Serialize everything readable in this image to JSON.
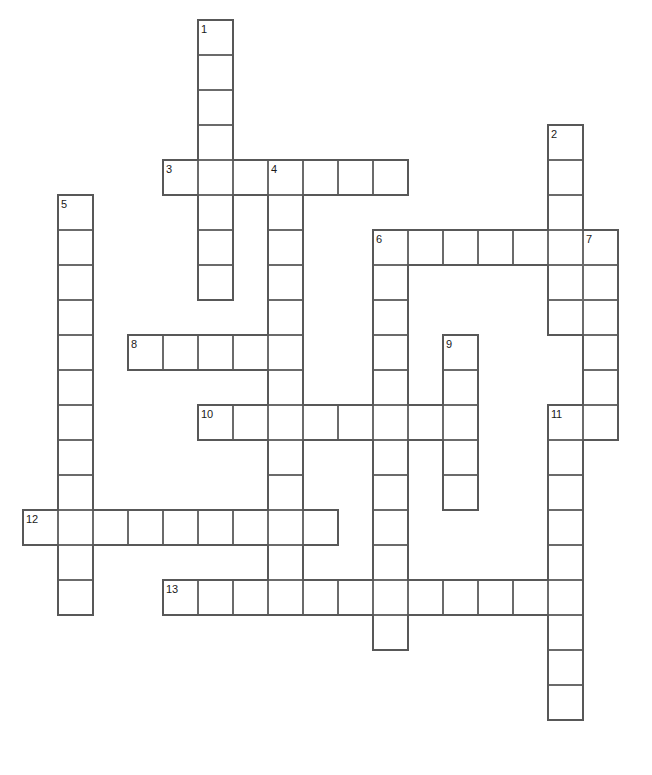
{
  "puzzle": {
    "title": "Crossword Puzzle Grid",
    "type": "crossword-grid",
    "cell_size": 35,
    "origin_x": 23,
    "origin_y": 20,
    "columns": 18,
    "rows": 21,
    "background_color": "#ffffff",
    "cell_border_color": "#6b6b6b",
    "outer_border_color": "#585858",
    "number_color": "#1a1a1a",
    "entries": [
      {
        "number": "1",
        "direction": "down",
        "col": 5,
        "row": 0,
        "length": 8
      },
      {
        "number": "2",
        "direction": "down",
        "col": 15,
        "row": 3,
        "length": 6
      },
      {
        "number": "3",
        "direction": "across",
        "col": 4,
        "row": 4,
        "length": 7
      },
      {
        "number": "4",
        "direction": "down",
        "col": 7,
        "row": 4,
        "length": 12
      },
      {
        "number": "5",
        "direction": "down",
        "col": 1,
        "row": 5,
        "length": 12
      },
      {
        "number": "6",
        "direction": "across",
        "col": 10,
        "row": 6,
        "length": 7
      },
      {
        "number": "6",
        "direction": "down",
        "col": 10,
        "row": 6,
        "length": 12
      },
      {
        "number": "7",
        "direction": "down",
        "col": 16,
        "row": 6,
        "length": 6
      },
      {
        "number": "8",
        "direction": "across",
        "col": 3,
        "row": 9,
        "length": 5
      },
      {
        "number": "9",
        "direction": "down",
        "col": 12,
        "row": 9,
        "length": 5
      },
      {
        "number": "10",
        "direction": "across",
        "col": 5,
        "row": 11,
        "length": 8
      },
      {
        "number": "11",
        "direction": "down",
        "col": 15,
        "row": 11,
        "length": 9
      },
      {
        "number": "12",
        "direction": "across",
        "col": 0,
        "row": 14,
        "length": 9
      },
      {
        "number": "13",
        "direction": "across",
        "col": 4,
        "row": 16,
        "length": 11
      }
    ],
    "numbered_labels": [
      {
        "label": "1",
        "col": 5,
        "row": 0
      },
      {
        "label": "2",
        "col": 15,
        "row": 3
      },
      {
        "label": "3",
        "col": 4,
        "row": 4
      },
      {
        "label": "4",
        "col": 7,
        "row": 4
      },
      {
        "label": "5",
        "col": 1,
        "row": 5
      },
      {
        "label": "6",
        "col": 10,
        "row": 6
      },
      {
        "label": "7",
        "col": 16,
        "row": 6
      },
      {
        "label": "8",
        "col": 3,
        "row": 9
      },
      {
        "label": "9",
        "col": 12,
        "row": 9
      },
      {
        "label": "10",
        "col": 5,
        "row": 11
      },
      {
        "label": "11",
        "col": 15,
        "row": 11
      },
      {
        "label": "12",
        "col": 0,
        "row": 14
      },
      {
        "label": "13",
        "col": 4,
        "row": 16
      }
    ],
    "filled_letters": []
  }
}
